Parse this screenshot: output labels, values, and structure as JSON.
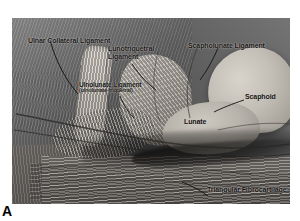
{
  "figure": {
    "panel_letter": "A",
    "caption_labels": [
      {
        "id": "ulnar-collateral-ligament",
        "text": "Ulnar Collateral Ligament"
      },
      {
        "id": "lunotriquetral-ligament",
        "line1": "Lunotriquetral",
        "line2": "Ligament"
      },
      {
        "id": "scapholunate-ligament",
        "text": "Scapholunate Ligament"
      },
      {
        "id": "ulnolunate-ligament",
        "text": "Ulnolunate Ligament",
        "subtitle": "(ulnolunate-triquetral)"
      },
      {
        "id": "scaphoid",
        "text": "Scaphoid"
      },
      {
        "id": "lunate",
        "text": "Lunate"
      },
      {
        "id": "triangular-fibrocartilage",
        "text": "Triangular Fibrocartilage"
      }
    ],
    "colors": {
      "plate_background": "#6a6a6a",
      "bone_light": "#cdc8c0",
      "label_text": "#12100f",
      "leader_line": "#111111",
      "page_background": "#ffffff"
    }
  },
  "labels": {
    "ulnar_collateral_ligament": "Ulnar Collateral Ligament",
    "lunotriquetral_line1": "Lunotriquetral",
    "lunotriquetral_line2": "Ligament",
    "scapholunate_ligament": "Scapholunate Ligament",
    "ulnolunate_ligament": "Ulnolunate Ligament",
    "ulnolunate_subtitle": "(ulnolunate-triquetral)",
    "scaphoid": "Scaphoid",
    "lunate": "Lunate",
    "triangular_fibrocartilage": "Triangular Fibrocartilage",
    "panel_letter": "A"
  }
}
